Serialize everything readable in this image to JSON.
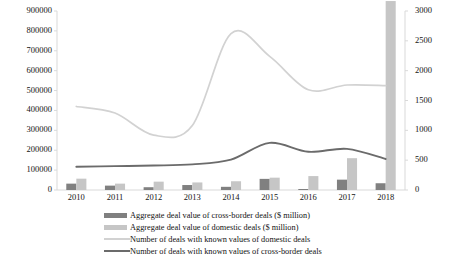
{
  "chart_data": {
    "type": "bar",
    "title": "",
    "xlabel": "",
    "ylabel": "",
    "grid": false,
    "legend_position": "bottom",
    "categories": [
      "2010",
      "2011",
      "2012",
      "2013",
      "2014",
      "2015",
      "2016",
      "2017",
      "2018"
    ],
    "axes": {
      "left": {
        "label": "",
        "ylim": [
          0,
          900000
        ],
        "ticks": [
          "0",
          "100000",
          "200000",
          "300000",
          "400000",
          "500000",
          "600000",
          "700000",
          "800000",
          "900000"
        ],
        "tick_values": [
          0,
          100000,
          200000,
          300000,
          400000,
          500000,
          600000,
          700000,
          800000,
          900000
        ],
        "applies_to": [
          "Aggregate deal value of cross-border deals ($ million)",
          "Aggregate deal value of domestic deals ($ million)"
        ]
      },
      "right": {
        "label": "",
        "ylim": [
          0,
          3000
        ],
        "ticks": [
          "0",
          "500",
          "1000",
          "1500",
          "2000",
          "2500",
          "3000"
        ],
        "tick_values": [
          0,
          500,
          1000,
          1500,
          2000,
          2500,
          3000
        ],
        "applies_to": [
          "Number of deals with known values of domestic deals",
          "Number of deals with known values of cross-border deals"
        ]
      }
    },
    "series": [
      {
        "name": "Aggregate deal value of cross-border deals ($ million)",
        "kind": "bar",
        "axis": "left",
        "color": "#808080",
        "values": [
          32000,
          22000,
          14000,
          25000,
          16000,
          56000,
          4000,
          52000,
          34000
        ]
      },
      {
        "name": "Aggregate deal value of domestic deals ($ million)",
        "kind": "bar",
        "axis": "left",
        "color": "#c6c6c6",
        "values": [
          57000,
          32000,
          42000,
          38000,
          44000,
          62000,
          70000,
          160000,
          950000
        ]
      },
      {
        "name": "Number of deals with known values of domestic deals",
        "kind": "line",
        "axis": "right",
        "color": "#d2d2d2",
        "values": [
          1400,
          1290,
          920,
          1080,
          2620,
          2240,
          1680,
          1760,
          1750
        ]
      },
      {
        "name": "Number of deals with known values of cross-border deals",
        "kind": "line",
        "axis": "right",
        "color": "#6b6b6b",
        "values": [
          390,
          400,
          410,
          430,
          510,
          790,
          640,
          690,
          520
        ]
      }
    ]
  },
  "legend": {
    "items": [
      {
        "label": "Aggregate deal value of cross-border deals ($ million)",
        "marker": "bar",
        "color": "#808080"
      },
      {
        "label": "Aggregate deal value of domestic deals ($ million)",
        "marker": "bar",
        "color": "#c6c6c6"
      },
      {
        "label": "Number of deals with known values of domestic deals",
        "marker": "line",
        "color": "#d2d2d2"
      },
      {
        "label": "Number of deals with known values of cross-border deals",
        "marker": "line",
        "color": "#6b6b6b"
      }
    ]
  },
  "colors": {
    "bar_cross_border": "#808080",
    "bar_domestic": "#c6c6c6",
    "line_domestic": "#d2d2d2",
    "line_cross_border": "#6b6b6b",
    "axis": "#d9d9d9",
    "text": "#141414",
    "background": "#ffffff"
  }
}
